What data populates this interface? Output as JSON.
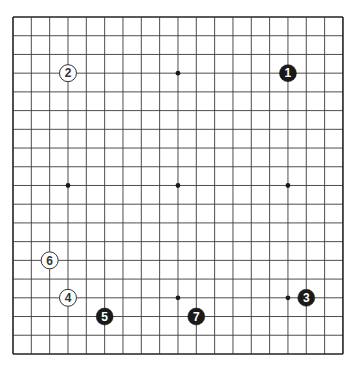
{
  "board": {
    "size": 19,
    "origin": {
      "x": 13,
      "y": 17
    },
    "spacing": {
      "x": 18.33,
      "y": 18.72
    },
    "line_color": "#3a3a3a",
    "border_color": "#222222",
    "background": "#ffffff",
    "star_points": [
      [
        3,
        3
      ],
      [
        9,
        3
      ],
      [
        15,
        3
      ],
      [
        3,
        9
      ],
      [
        9,
        9
      ],
      [
        15,
        9
      ],
      [
        3,
        15
      ],
      [
        9,
        15
      ],
      [
        15,
        15
      ]
    ]
  },
  "stones": [
    {
      "move": "1",
      "color": "black",
      "col": 15,
      "row": 3
    },
    {
      "move": "2",
      "color": "white",
      "col": 3,
      "row": 3
    },
    {
      "move": "3",
      "color": "black",
      "col": 16,
      "row": 15
    },
    {
      "move": "4",
      "color": "white",
      "col": 3,
      "row": 15
    },
    {
      "move": "5",
      "color": "black",
      "col": 5,
      "row": 16
    },
    {
      "move": "6",
      "color": "white",
      "col": 2,
      "row": 13
    },
    {
      "move": "7",
      "color": "black",
      "col": 10,
      "row": 16
    }
  ],
  "colors": {
    "black_stone": "#1a1a1a",
    "black_label": "#ffffff",
    "white_stone": "#ffffff",
    "white_outline": "#333333",
    "white_label": "#333333"
  }
}
